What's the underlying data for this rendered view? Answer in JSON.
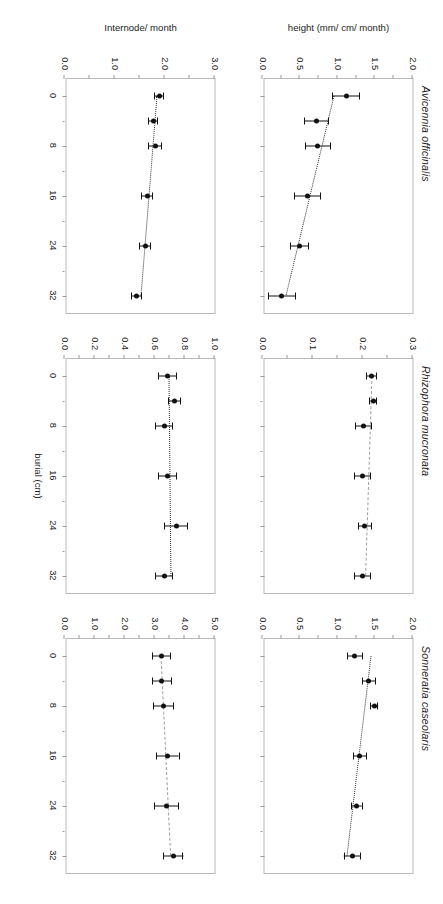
{
  "figure": {
    "xlabel": "burial (cm)",
    "x_ticks": [
      0,
      8,
      16,
      24,
      32
    ],
    "x_minor_ticks": [
      4,
      12,
      20,
      28
    ],
    "xlim": [
      -2.8,
      35
    ],
    "row_labels": [
      "height (mm/ cm/ month)",
      "Internode/ month"
    ],
    "columns": [
      "Avicennia officinalis",
      "Rhizophora mucronata",
      "Sonneratia caseolaris"
    ]
  },
  "chart_data": [
    {
      "id": "avicennia-height",
      "type": "scatter",
      "title": "Avicennia officinalis",
      "xlabel": "burial (cm)",
      "ylabel": "height (mm/ cm/ month)",
      "xlim": [
        -2.8,
        35
      ],
      "ylim": [
        0.0,
        2.0
      ],
      "y_ticks": [
        0.0,
        0.5,
        1.0,
        1.5,
        2.0
      ],
      "y_tick_labels": [
        "0.0",
        "0.5",
        "1.0",
        "1.5",
        "2.0"
      ],
      "y_minor_ticks": [
        0.25,
        0.75,
        1.25,
        1.75
      ],
      "x": [
        0,
        4,
        8,
        16,
        24,
        32
      ],
      "y": [
        1.12,
        0.72,
        0.74,
        0.6,
        0.5,
        0.26
      ],
      "yerr": [
        0.18,
        0.16,
        0.17,
        0.17,
        0.12,
        0.18
      ],
      "annotation": {
        "equation": "y = 0.96 - 0.02x",
        "r2": "r² = 0.84, p<0.01",
        "r2_value": 0.84,
        "p_text": "p<0.01"
      },
      "fit": {
        "intercept": 0.96,
        "slope": -0.02,
        "style": "dotted"
      }
    },
    {
      "id": "rhizophora-height",
      "type": "scatter",
      "title": "Rhizophora mucronata",
      "xlabel": "burial (cm)",
      "ylabel": "height (mm/ cm/ month)",
      "xlim": [
        -2.8,
        35
      ],
      "ylim": [
        0.0,
        0.3
      ],
      "y_ticks": [
        0.0,
        0.1,
        0.2,
        0.3
      ],
      "y_tick_labels": [
        "0.0",
        "0.1",
        "0.2",
        "0.3"
      ],
      "y_minor_ticks": [
        0.05,
        0.15,
        0.25
      ],
      "x": [
        0,
        4,
        8,
        16,
        24,
        32
      ],
      "y": [
        0.218,
        0.222,
        0.202,
        0.201,
        0.205,
        0.2
      ],
      "yerr": [
        0.01,
        0.007,
        0.016,
        0.016,
        0.013,
        0.016
      ],
      "annotation": {
        "equation": "y = 0.22 - 0.0004x",
        "r2": "r² = 0.61, p<0.10",
        "r2_value": 0.61,
        "p_text": "p<0.10"
      },
      "fit": {
        "intercept": 0.22,
        "slope": -0.0004,
        "style": "dashed-grey"
      }
    },
    {
      "id": "sonneratia-height",
      "type": "scatter",
      "title": "Sonneratia caseolaris",
      "xlabel": "burial (cm)",
      "ylabel": "height (mm/ cm/ month)",
      "xlim": [
        -2.8,
        35
      ],
      "ylim": [
        0.0,
        2.0
      ],
      "y_ticks": [
        0.0,
        0.5,
        1.0,
        1.5,
        2.0
      ],
      "y_tick_labels": [
        "0.0",
        "0.5",
        "1.0",
        "1.5",
        "2.0"
      ],
      "y_minor_ticks": [
        0.25,
        0.75,
        1.25,
        1.75
      ],
      "x": [
        0,
        4,
        8,
        16,
        24,
        32
      ],
      "y": [
        1.23,
        1.42,
        1.49,
        1.3,
        1.26,
        1.2
      ],
      "yerr": [
        0.1,
        0.09,
        0.05,
        0.09,
        0.07,
        0.11
      ],
      "annotation": {
        "equation": "y = 1.45 - 0.01x",
        "r2": "r² = 0.42, p<0.50",
        "r2_value": 0.42,
        "p_text": "p<0.50"
      },
      "fit": {
        "intercept": 1.45,
        "slope": -0.01,
        "style": "dotted"
      }
    },
    {
      "id": "avicennia-internode",
      "type": "scatter",
      "title": "Avicennia officinalis",
      "xlabel": "burial (cm)",
      "ylabel": "Internode/ month",
      "xlim": [
        -2.8,
        35
      ],
      "ylim": [
        0.0,
        3.0
      ],
      "y_ticks": [
        0.0,
        1.0,
        2.0,
        3.0
      ],
      "y_tick_labels": [
        "0.0",
        "1.0",
        "2.0",
        "3.0"
      ],
      "y_minor_ticks": [
        0.5,
        1.5,
        2.5
      ],
      "x": [
        0,
        4,
        8,
        16,
        24,
        32
      ],
      "y": [
        1.9,
        1.78,
        1.82,
        1.66,
        1.62,
        1.44
      ],
      "yerr": [
        0.09,
        0.09,
        0.13,
        0.11,
        0.11,
        0.1
      ],
      "annotation": {
        "equation": "y = 1.86 - 0.01x",
        "r2": "r² = 0.78, p<0.05",
        "r2_value": 0.78,
        "p_text": "p<0.05"
      },
      "fit": {
        "intercept": 1.86,
        "slope": -0.01,
        "style": "dotted"
      }
    },
    {
      "id": "rhizophora-internode",
      "type": "scatter",
      "title": "Rhizophora mucronata",
      "xlabel": "burial (cm)",
      "ylabel": "Internode/ month",
      "xlim": [
        -2.8,
        35
      ],
      "ylim": [
        0.0,
        1.0
      ],
      "y_ticks": [
        0.0,
        0.2,
        0.4,
        0.6,
        0.8,
        1.0
      ],
      "y_tick_labels": [
        "0.0",
        "0.2",
        "0.4",
        "0.6",
        "0.8",
        "1.0"
      ],
      "y_minor_ticks": [
        0.1,
        0.3,
        0.5,
        0.7,
        0.9
      ],
      "x": [
        0,
        4,
        8,
        16,
        24,
        32
      ],
      "y": [
        0.685,
        0.735,
        0.665,
        0.685,
        0.745,
        0.665
      ],
      "yerr": [
        0.06,
        0.04,
        0.055,
        0.06,
        0.075,
        0.055
      ],
      "annotation": {
        "equation": "y = 0.70 + 0.0004x",
        "r2": "r² = 0.02, p<0.50",
        "r2_value": 0.02,
        "p_text": "p<0.50"
      },
      "fit": {
        "intercept": 0.7,
        "slope": 0.0004,
        "style": "dotted"
      }
    },
    {
      "id": "sonneratia-internode",
      "type": "scatter",
      "title": "Sonneratia caseolaris",
      "xlabel": "burial (cm)",
      "ylabel": "Internode/ month",
      "xlim": [
        -2.8,
        35
      ],
      "ylim": [
        0.0,
        5.0
      ],
      "y_ticks": [
        0.0,
        1.0,
        2.0,
        3.0,
        4.0,
        5.0
      ],
      "y_tick_labels": [
        "0.0",
        "1.0",
        "2.0",
        "3.0",
        "4.0",
        "5.0"
      ],
      "y_minor_ticks": [
        0.5,
        1.5,
        2.5,
        3.5,
        4.5
      ],
      "x": [
        0,
        4,
        8,
        16,
        24,
        32
      ],
      "y": [
        3.22,
        3.25,
        3.3,
        3.45,
        3.4,
        3.62
      ],
      "yerr": [
        0.3,
        0.33,
        0.33,
        0.37,
        0.4,
        0.33
      ],
      "annotation": {
        "equation": "y = 3.22 +0.01x",
        "r2": "r² = 0.96, p<0.01",
        "r2_value": 0.96,
        "p_text": "p<0.01"
      },
      "fit": {
        "intercept": 3.22,
        "slope": 0.01,
        "style": "dashed-grey"
      }
    }
  ]
}
